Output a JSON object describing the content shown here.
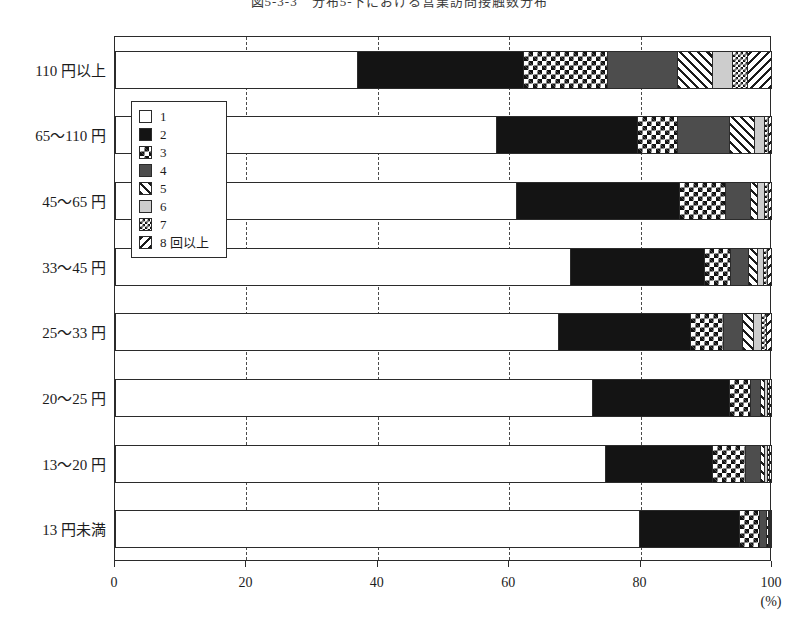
{
  "title": "図5-3-3　分布5-下における営業訪問接触数分布",
  "axis": {
    "x_ticks": [
      "0",
      "20",
      "40",
      "60",
      "80",
      "100"
    ],
    "x_unit": "(%)",
    "xlim": [
      0,
      100
    ]
  },
  "legend": {
    "items": [
      {
        "label": "1",
        "pattern": "white"
      },
      {
        "label": "2",
        "pattern": "black"
      },
      {
        "label": "3",
        "pattern": "coarse-checker"
      },
      {
        "label": "4",
        "pattern": "dark-gray"
      },
      {
        "label": "5",
        "pattern": "diagonal-hatch-right"
      },
      {
        "label": "6",
        "pattern": "light-gray"
      },
      {
        "label": "7",
        "pattern": "fine-checker"
      },
      {
        "label": "8 回以上",
        "pattern": "diagonal-hatch-left"
      }
    ]
  },
  "chart_data": {
    "type": "bar",
    "orientation": "horizontal",
    "stacked": true,
    "normalized_percent": true,
    "title": "図5-3-3　分布5-下における営業訪問接触数分布",
    "xlabel": "(%)",
    "ylabel": "",
    "xlim": [
      0,
      100
    ],
    "grid": true,
    "legend_position": "inside-upper-left",
    "categories": [
      "110 円以上",
      "65〜110 円",
      "45〜65 円",
      "33〜45 円",
      "25〜33 円",
      "20〜25 円",
      "13〜20 円",
      "13 円未満"
    ],
    "series": [
      {
        "name": "1",
        "values": [
          36.8,
          58.0,
          61.0,
          69.3,
          67.4,
          72.6,
          74.7,
          80.0
        ]
      },
      {
        "name": "2",
        "values": [
          25.4,
          21.5,
          25.0,
          20.4,
          20.2,
          21.0,
          16.3,
          15.2
        ]
      },
      {
        "name": "3",
        "values": [
          12.8,
          6.2,
          7.0,
          4.1,
          5.0,
          3.2,
          5.0,
          3.0
        ]
      },
      {
        "name": "4",
        "values": [
          10.7,
          7.9,
          3.8,
          2.7,
          2.9,
          1.5,
          2.3,
          1.1
        ]
      },
      {
        "name": "5",
        "values": [
          5.3,
          3.8,
          1.1,
          1.4,
          1.8,
          0.7,
          0.7,
          0.3
        ]
      },
      {
        "name": "6",
        "values": [
          3.0,
          1.5,
          1.1,
          0.9,
          1.2,
          0.4,
          0.4,
          0.2
        ]
      },
      {
        "name": "7",
        "values": [
          2.4,
          0.6,
          0.5,
          0.6,
          0.8,
          0.3,
          0.3,
          0.1
        ]
      },
      {
        "name": "8 回以上",
        "values": [
          3.6,
          0.5,
          0.5,
          0.6,
          0.7,
          0.3,
          0.3,
          0.1
        ]
      }
    ]
  }
}
